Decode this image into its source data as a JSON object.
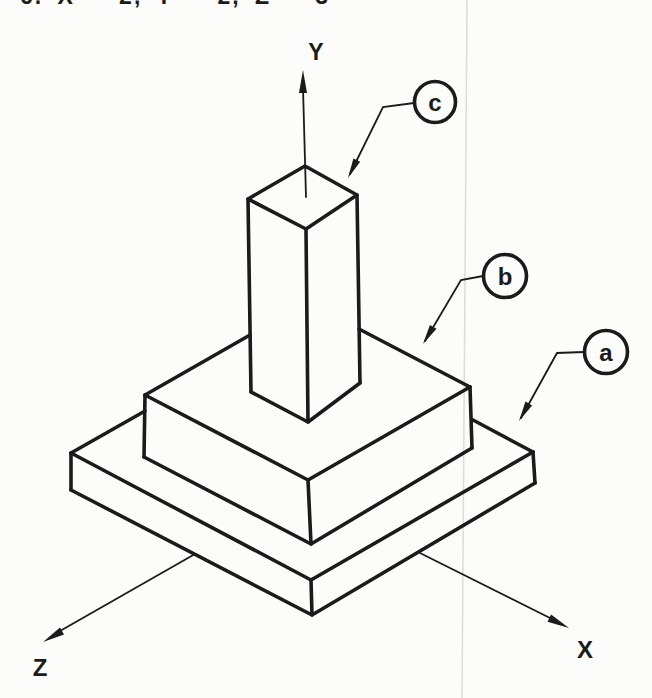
{
  "theme": {
    "paper": "#fcfcfb",
    "ink": "#1b1b1b",
    "artifact": "#dcdcd4"
  },
  "header": {
    "clipped_line": "6. X = 2, Y = 2, Z = 3"
  },
  "figure": {
    "type": "isometric-line-drawing",
    "description_visible_parts": "three stacked rectangular prisms with coordinate axes",
    "axis_labels": {
      "y": "Y",
      "x": "X",
      "z": "Z"
    },
    "callouts": [
      {
        "label": "c"
      },
      {
        "label": "b"
      },
      {
        "label": "a"
      }
    ]
  }
}
